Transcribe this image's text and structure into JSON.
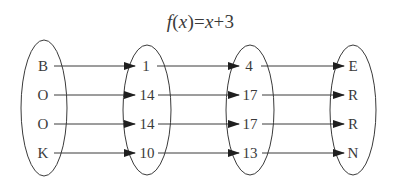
{
  "title": {
    "func": "f",
    "open": "(",
    "var": "x",
    "close": ")",
    "eq": "=",
    "var2": "x",
    "plus": "+",
    "const": "3"
  },
  "colors": {
    "stroke": "#3a3a3a",
    "text": "#3a3a3a",
    "background": "#ffffff"
  },
  "sets": [
    {
      "name": "letters",
      "items": [
        "B",
        "O",
        "O",
        "K"
      ]
    },
    {
      "name": "numbers",
      "items": [
        "1",
        "14",
        "14",
        "10"
      ]
    },
    {
      "name": "shifted-numbers",
      "items": [
        "4",
        "17",
        "17",
        "13"
      ]
    },
    {
      "name": "encoded-letters",
      "items": [
        "E",
        "R",
        "R",
        "N"
      ]
    }
  ],
  "mappings": [
    {
      "from_set": 0,
      "to_set": 1,
      "pairs": [
        [
          "B",
          "1"
        ],
        [
          "O",
          "14"
        ],
        [
          "O",
          "14"
        ],
        [
          "K",
          "10"
        ]
      ]
    },
    {
      "from_set": 1,
      "to_set": 2,
      "pairs": [
        [
          "1",
          "4"
        ],
        [
          "14",
          "17"
        ],
        [
          "14",
          "17"
        ],
        [
          "10",
          "13"
        ]
      ]
    },
    {
      "from_set": 2,
      "to_set": 3,
      "pairs": [
        [
          "4",
          "E"
        ],
        [
          "17",
          "R"
        ],
        [
          "17",
          "R"
        ],
        [
          "13",
          "N"
        ]
      ]
    }
  ]
}
